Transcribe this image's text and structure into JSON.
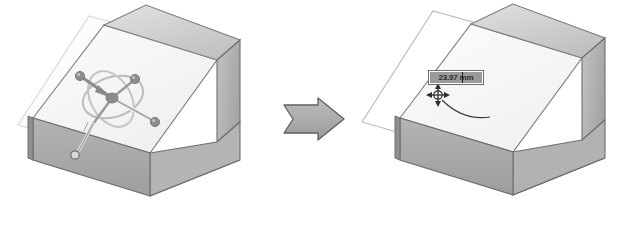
{
  "figure": {
    "type": "cad-before-after-illustration",
    "background_color": "#ffffff",
    "width": 630,
    "height": 240
  },
  "colors": {
    "face_top_slope": "#f3f3f3",
    "face_front": "#a9a9a9",
    "face_right": "#b7b7b7",
    "face_top_ridge": "#cfcfcf",
    "outline": "#6e6e6e",
    "sketch_plane_fill": "#fbfbfb",
    "sketch_plane_stroke": "#d2d2d2",
    "manipulator": "#8c8c8c",
    "manipulator_ring": "#b9b9b9",
    "handle_sphere": "#8a8a8a",
    "arrow_fill": "#a8a8a8",
    "arrow_stroke": "#5f5f5f",
    "dim_field_background": "#9a9a9a",
    "dim_field_border": "#6e6e6e",
    "dim_text": "#2b2b2b",
    "cursor": "#3a3a3a"
  },
  "panels": {
    "before": {
      "name": "before-state",
      "label": "Block with 3D move manipulator on sketch plane",
      "solid": {
        "name": "wedge-block",
        "description": "Rectangular block with inclined ramp face"
      },
      "sketch_plane": {
        "name": "sketch-plane-overlay",
        "description": "Translucent sketch plane offset above the inclined face"
      },
      "manipulator": {
        "name": "triad-manipulator",
        "description": "3D move/rotate triad with spherical drag handles and rotation rings",
        "handles": [
          {
            "name": "handle-x",
            "label": "X axis handle"
          },
          {
            "name": "handle-y",
            "label": "Y axis handle"
          },
          {
            "name": "handle-z",
            "label": "Z axis handle"
          },
          {
            "name": "handle-origin",
            "label": "Origin handle"
          }
        ],
        "rings": 2
      }
    },
    "arrow": {
      "name": "transition-arrow",
      "label": "leads to",
      "direction": "right"
    },
    "after": {
      "name": "after-state",
      "label": "Block with offset sketch plane and dimension input",
      "solid": {
        "name": "wedge-block",
        "description": "Rectangular block with inclined ramp face"
      },
      "sketch_plane": {
        "name": "sketch-plane-overlay-moved",
        "description": "Sketch plane translated away from the inclined face"
      },
      "dimension_field": {
        "name": "offset-dimension-input",
        "value": "23.97",
        "unit": "mm",
        "display": "23.97 mm",
        "selected": true
      },
      "cursor": {
        "name": "move-cursor",
        "type": "four-way-move",
        "label": "Move cursor"
      },
      "leader": {
        "name": "leader-line",
        "label": "Curved leader from cursor to plane"
      }
    }
  }
}
